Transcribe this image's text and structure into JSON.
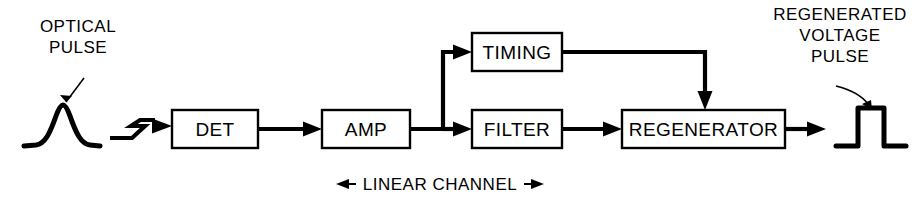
{
  "diagram": {
    "background_color": "#ffffff",
    "line_color": "#000000",
    "blocks": [
      {
        "id": "det",
        "label": "DET",
        "x": 172,
        "y": 110,
        "w": 86,
        "h": 38
      },
      {
        "id": "amp",
        "label": "AMP",
        "x": 322,
        "y": 110,
        "w": 88,
        "h": 38
      },
      {
        "id": "timing",
        "label": "TIMING",
        "x": 472,
        "y": 33,
        "w": 90,
        "h": 38
      },
      {
        "id": "filter",
        "label": "FILTER",
        "x": 472,
        "y": 110,
        "w": 90,
        "h": 38
      },
      {
        "id": "regenerator",
        "label": "REGENERATOR",
        "x": 622,
        "y": 110,
        "w": 163,
        "h": 38
      }
    ],
    "annotations": [
      {
        "id": "input-callout",
        "lines": [
          "OPTICAL",
          "PULSE"
        ],
        "text_anchor_x": 78,
        "first_line_y": 32,
        "line_height": 21
      },
      {
        "id": "output-callout",
        "lines": [
          "REGENERATED",
          "VOLTAGE",
          "PULSE"
        ],
        "text_anchor_x": 840,
        "first_line_y": 20,
        "line_height": 21
      }
    ],
    "channel_bracket": {
      "id": "linear-channel",
      "label": "LINEAR CHANNEL",
      "left_arrow": "←",
      "right_arrow": "→",
      "center_x": 440,
      "y": 184
    },
    "waveforms": [
      {
        "id": "optical-pulse-wave",
        "kind": "gaussian-pulse",
        "center_x": 60,
        "baseline_y": 146
      },
      {
        "id": "regenerated-pulse-wave",
        "kind": "square-pulse",
        "center_x": 868,
        "baseline_y": 146
      }
    ],
    "links": [
      {
        "id": "fiber-to-det",
        "from": "optical-pulse-wave",
        "to": "det",
        "kind": "zigzag-fiber"
      },
      {
        "id": "det-to-amp",
        "from": "det",
        "to": "amp",
        "kind": "straight"
      },
      {
        "id": "amp-to-branch",
        "from": "amp",
        "to": "branch-node",
        "kind": "straight"
      },
      {
        "id": "branch-to-timing",
        "from": "branch-node",
        "to": "timing",
        "kind": "elbow-up"
      },
      {
        "id": "branch-to-filter",
        "from": "branch-node",
        "to": "filter",
        "kind": "straight"
      },
      {
        "id": "filter-to-regen",
        "from": "filter",
        "to": "regenerator",
        "kind": "straight"
      },
      {
        "id": "timing-to-regen",
        "from": "timing",
        "to": "regenerator",
        "kind": "elbow-down"
      },
      {
        "id": "regen-to-output",
        "from": "regenerator",
        "to": "regenerated-pulse-wave",
        "kind": "straight"
      }
    ]
  }
}
